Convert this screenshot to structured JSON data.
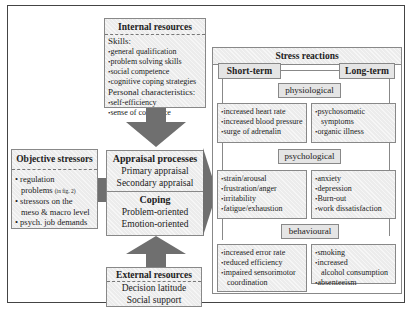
{
  "internal_resources": {
    "title": "Internal resources",
    "skills_label": "Skills:",
    "skills": [
      "general qualification",
      "problem solving skills",
      "social competence",
      "cognitive coping strategies"
    ],
    "personal_label": "Personal characteristics:",
    "personal": [
      "self-efficiency",
      "sense of coherence"
    ]
  },
  "objective_stressors": {
    "title": "Objective stressors",
    "items": [
      "regulation problems",
      "stressors on the meso & macro level",
      "psych. job demands"
    ],
    "item1_line1": "regulation",
    "item1_line2": "problems",
    "item1_note": "(in fig. 2)",
    "item2_line1": "stressors on the",
    "item2_line2": "meso & macro level",
    "item3": "psych. job demands"
  },
  "appraisal": {
    "title": "Appraisal processes",
    "items": [
      "Primary appraisal",
      "Secondary appraisal"
    ]
  },
  "coping": {
    "title": "Coping",
    "items": [
      "Problem-oriented",
      "Emotion-oriented"
    ]
  },
  "external_resources": {
    "title": "External resources",
    "items": [
      "Decision latitude",
      "Social support"
    ]
  },
  "stress_reactions": {
    "title": "Stress reactions",
    "short_term": "Short-term",
    "long_term": "Long-term",
    "categories": [
      {
        "label": "physiological",
        "short": [
          "increased heart rate",
          "increased blood pressure",
          "surge of adrenalin"
        ],
        "long": [
          "psychosomatic symptoms",
          "organic illness"
        ],
        "long_lines": [
          [
            "psychosomatic",
            "symptoms"
          ],
          [
            "organic illness"
          ]
        ]
      },
      {
        "label": "psychological",
        "short": [
          "strain/arousal",
          "frustration/anger",
          "irritability",
          "fatigue/exhaustion"
        ],
        "long": [
          "anxiety",
          "depression",
          "Burn-out",
          "work dissatisfaction"
        ]
      },
      {
        "label": "behavioural",
        "short": [
          "increased error rate",
          "reduced efficiency",
          "impaired sensorimotor coordination"
        ],
        "short_lines": [
          [
            "increased error rate"
          ],
          [
            "reduced efficiency"
          ],
          [
            "impaired sensorimotor",
            "coordination"
          ]
        ],
        "long": [
          "smoking",
          "increased alcohol consumption",
          "absenteeism"
        ],
        "long_lines": [
          [
            "smoking"
          ],
          [
            "increased",
            "alcohol consumption"
          ],
          [
            "absenteeism"
          ]
        ]
      }
    ]
  },
  "colors": {
    "arrow": "#6f6f6f",
    "box_fill": "#ececec",
    "border": "#888888",
    "frame": "#444444"
  }
}
